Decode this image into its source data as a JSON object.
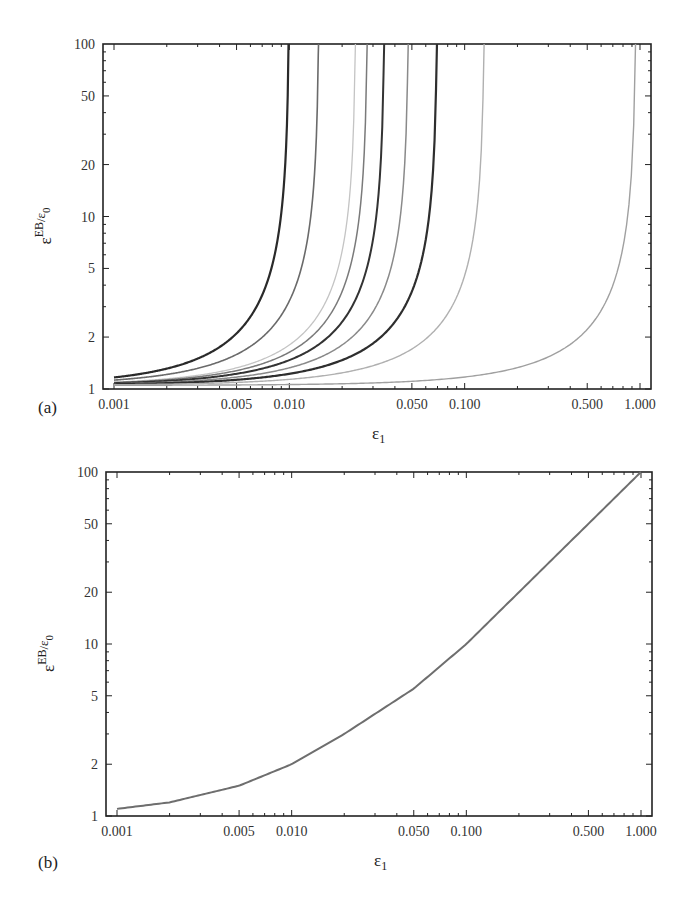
{
  "chart_data": [
    {
      "panel": "(a)",
      "type": "line",
      "title": "",
      "xlabel": "ε1",
      "ylabel": "εEB/ε0",
      "xscale": "log",
      "yscale": "log",
      "xlim": [
        0.001,
        1.0
      ],
      "ylim": [
        1,
        100
      ],
      "grid": false,
      "legend": null,
      "xticks": [
        "0.001",
        "0.005",
        "0.010",
        "0.050",
        "0.100",
        "0.500",
        "1.000"
      ],
      "xtick_values": [
        0.001,
        0.005,
        0.01,
        0.05,
        0.1,
        0.5,
        1.0
      ],
      "yticks": [
        "1",
        "2",
        "5",
        "10",
        "20",
        "50",
        "100"
      ],
      "ytick_values": [
        1,
        2,
        5,
        10,
        20,
        50,
        100
      ],
      "series_description": "Family of curves rising from ~1 and diverging vertically at a critical ε1 (asymptote)",
      "series": [
        {
          "name": "curve-1",
          "asymptote": 0.01,
          "color": "#2a2a2a",
          "width": 2.2
        },
        {
          "name": "curve-2",
          "asymptote": 0.0148,
          "color": "#6a6a6a",
          "width": 1.6
        },
        {
          "name": "curve-3",
          "asymptote": 0.024,
          "color": "#c4c4c4",
          "width": 1.3
        },
        {
          "name": "curve-4",
          "asymptote": 0.028,
          "color": "#7a7a7a",
          "width": 1.5
        },
        {
          "name": "curve-5",
          "asymptote": 0.035,
          "color": "#333333",
          "width": 2.0
        },
        {
          "name": "curve-6",
          "asymptote": 0.048,
          "color": "#8a8a8a",
          "width": 1.5
        },
        {
          "name": "curve-7",
          "asymptote": 0.07,
          "color": "#2e2e2e",
          "width": 2.2
        },
        {
          "name": "curve-8",
          "asymptote": 0.13,
          "color": "#b0b0b0",
          "width": 1.4
        },
        {
          "name": "curve-9",
          "asymptote": 0.95,
          "color": "#a0a0a0",
          "width": 1.4
        }
      ]
    },
    {
      "panel": "(b)",
      "type": "line",
      "title": "",
      "xlabel": "ε1",
      "ylabel": "εEB/ε0",
      "xscale": "log",
      "yscale": "log",
      "xlim": [
        0.001,
        1.0
      ],
      "ylim": [
        1,
        100
      ],
      "grid": false,
      "legend": null,
      "xticks": [
        "0.001",
        "0.005",
        "0.010",
        "0.050",
        "0.100",
        "0.500",
        "1.000"
      ],
      "xtick_values": [
        0.001,
        0.005,
        0.01,
        0.05,
        0.1,
        0.5,
        1.0
      ],
      "yticks": [
        "1",
        "2",
        "5",
        "10",
        "20",
        "50",
        "100"
      ],
      "ytick_values": [
        1,
        2,
        5,
        10,
        20,
        50,
        100
      ],
      "series": [
        {
          "name": "curve",
          "color": "#6e6e6e",
          "x": [
            0.001,
            0.002,
            0.005,
            0.01,
            0.02,
            0.05,
            0.1,
            0.2,
            0.5,
            1.0
          ],
          "y": [
            1.1,
            1.2,
            1.5,
            2.0,
            3.0,
            5.5,
            10,
            20,
            50,
            100
          ]
        }
      ]
    }
  ],
  "panels": {
    "a": {
      "label": "(a)",
      "xlabel_main": "ε",
      "xlabel_sub": "1",
      "ylabel_main": "ε",
      "ylabel_sup": "EB",
      "ylabel_tail": "/ε",
      "ylabel_sub": "0"
    },
    "b": {
      "label": "(b)",
      "xlabel_main": "ε",
      "xlabel_sub": "1",
      "ylabel_main": "ε",
      "ylabel_sup": "EB",
      "ylabel_tail": "/ε",
      "ylabel_sub": "0"
    }
  }
}
